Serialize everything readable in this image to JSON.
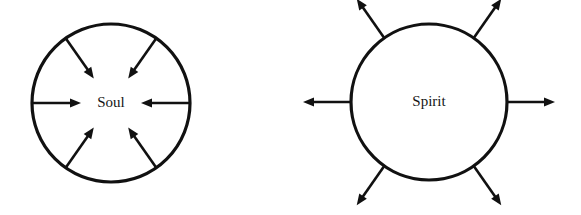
{
  "figure": {
    "width": 581,
    "height": 215,
    "background_color": "#ffffff",
    "stroke_color": "#111111",
    "text_color": "#151515"
  },
  "diagrams": [
    {
      "id": "soul",
      "label": "Soul",
      "label_font_size": 15,
      "direction": "inward",
      "center": {
        "x": 111,
        "y": 103
      },
      "radius": 79,
      "circle_stroke_width": 3.2,
      "arrow_stroke_width": 2.6,
      "arrow_count": 6,
      "arrow_angles_deg": [
        0,
        55,
        125,
        180,
        235,
        305
      ],
      "arrow_inner_radius": 30,
      "arrow_outer_radius": 79
    },
    {
      "id": "spirit",
      "label": "Spirit",
      "label_font_size": 15,
      "direction": "outward",
      "center": {
        "x": 429,
        "y": 102
      },
      "radius": 78,
      "circle_stroke_width": 3.2,
      "arrow_stroke_width": 2.6,
      "arrow_count": 6,
      "arrow_angles_deg": [
        0,
        55,
        125,
        180,
        235,
        305
      ],
      "arrow_inner_radius": 78,
      "arrow_outer_radius": 126
    }
  ]
}
